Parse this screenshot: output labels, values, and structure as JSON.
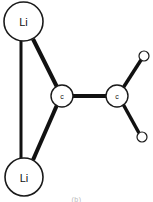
{
  "figure": {
    "caption": "(b)",
    "background_color": "#ffffff",
    "bond_color": "#111111",
    "atom_outline_color": "#1a1a1a",
    "atom_fill_color": "#ffffff",
    "label_color": "#111111"
  },
  "atoms": [
    {
      "id": "li-top",
      "element": "Li",
      "label": "Li",
      "cx": 23.5,
      "cy": 21.5,
      "r": 19.5,
      "stroke_width": 1.6,
      "label_size": 11
    },
    {
      "id": "li-bottom",
      "element": "Li",
      "label": "Li",
      "cx": 24,
      "cy": 177,
      "r": 19,
      "stroke_width": 1.6,
      "label_size": 11
    },
    {
      "id": "c-center",
      "element": "C",
      "label": "c",
      "cx": 62,
      "cy": 96,
      "r": 11,
      "stroke_width": 1.4,
      "label_size": 7
    },
    {
      "id": "c-right",
      "element": "C",
      "label": "c",
      "cx": 117,
      "cy": 96,
      "r": 11,
      "stroke_width": 1.4,
      "label_size": 7
    },
    {
      "id": "h-upper",
      "element": "H",
      "label": "",
      "cx": 144,
      "cy": 56,
      "r": 5,
      "stroke_width": 1.2,
      "label_size": 0
    },
    {
      "id": "h-lower",
      "element": "H",
      "label": "",
      "cx": 142,
      "cy": 137,
      "r": 5,
      "stroke_width": 1.2,
      "label_size": 0
    }
  ],
  "bonds": [
    {
      "id": "bond-li-top-li-bottom",
      "from": "li-top",
      "to": "li-bottom",
      "x1": 21,
      "y1": 41,
      "x2": 21,
      "y2": 158,
      "width": 3
    },
    {
      "id": "bond-li-top-c-center",
      "from": "li-top",
      "to": "c-center",
      "x1": 33,
      "y1": 39,
      "x2": 57,
      "y2": 87,
      "width": 4
    },
    {
      "id": "bond-li-bottom-c-center",
      "from": "li-bottom",
      "to": "c-center",
      "x1": 33,
      "y1": 160,
      "x2": 57,
      "y2": 105,
      "width": 4
    },
    {
      "id": "bond-c-center-c-right",
      "from": "c-center",
      "to": "c-right",
      "x1": 72,
      "y1": 96,
      "x2": 107,
      "y2": 96,
      "width": 4
    },
    {
      "id": "bond-c-right-h-upper",
      "from": "c-right",
      "to": "h-upper",
      "x1": 123,
      "y1": 88,
      "x2": 141,
      "y2": 60,
      "width": 3.5
    },
    {
      "id": "bond-c-right-h-lower",
      "from": "c-right",
      "to": "h-lower",
      "x1": 123,
      "y1": 104,
      "x2": 139,
      "y2": 133,
      "width": 3.5
    }
  ]
}
